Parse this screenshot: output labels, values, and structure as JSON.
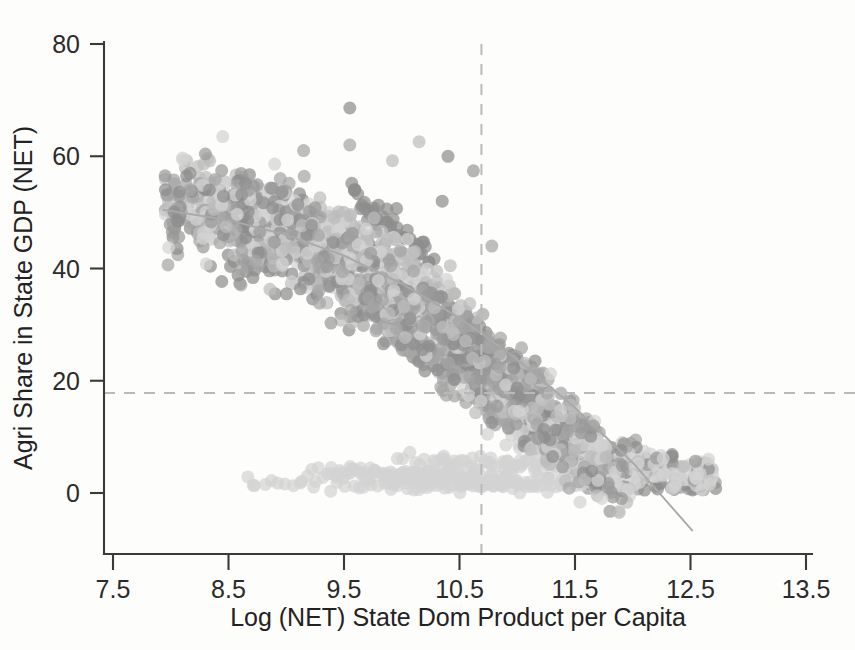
{
  "chart_data": {
    "type": "scatter",
    "title": "",
    "xlabel": "Log (NET) State Dom Product per Capita",
    "ylabel": "Agri Share in State GDP (NET)",
    "xlim": [
      7.5,
      13.5
    ],
    "ylim": [
      -10,
      85
    ],
    "x_ticks": [
      "7.5",
      "8.5",
      "9.5",
      "10.5",
      "11.5",
      "12.5",
      "13.5"
    ],
    "x_tick_values": [
      7.5,
      8.5,
      9.5,
      10.5,
      11.5,
      12.5,
      13.5
    ],
    "y_ticks": [
      "0",
      "20",
      "40",
      "60",
      "80"
    ],
    "y_tick_values": [
      0,
      20,
      40,
      60,
      80
    ],
    "grid": false,
    "legend": "none",
    "marker": {
      "shape": "circle",
      "size_px": 13,
      "opacity": 0.72,
      "palette": [
        "#8e8e8e",
        "#a5a5a5",
        "#bcbcbc",
        "#d2d2d2",
        "#9a9a9a"
      ]
    },
    "reference_lines": [
      {
        "name": "vertical-reference-line",
        "orientation": "vertical",
        "value": 10.69,
        "style": "dashed",
        "color": "#b9b9b9"
      },
      {
        "name": "horizontal-reference-line",
        "orientation": "horizontal",
        "value": 17.8,
        "style": "dashed",
        "color": "#b9b9b9"
      }
    ],
    "fit_line": {
      "name": "quadratic-fit-line",
      "color": "#a9a9a9",
      "points": [
        [
          7.93,
          50.5
        ],
        [
          8.5,
          48.6
        ],
        [
          9.0,
          46.0
        ],
        [
          9.5,
          42.3
        ],
        [
          10.0,
          37.3
        ],
        [
          10.5,
          31.2
        ],
        [
          11.0,
          23.8
        ],
        [
          11.5,
          15.2
        ],
        [
          12.0,
          5.4
        ],
        [
          12.52,
          -6.8
        ]
      ]
    },
    "series": [
      {
        "name": "state-year-observations",
        "x": [
          7.93,
          7.97,
          8.02,
          8.05,
          8.08,
          8.12,
          8.15,
          8.18,
          8.2,
          8.22,
          8.24,
          8.26,
          8.28,
          8.3,
          8.32,
          8.34,
          8.36,
          8.38,
          8.4,
          8.42,
          8.44,
          8.46,
          8.48,
          8.5,
          8.52,
          8.54,
          8.56,
          8.58,
          8.6,
          8.62,
          8.64,
          8.66,
          8.68,
          8.7,
          8.72,
          8.74,
          8.76,
          8.78,
          8.8,
          8.82,
          8.84,
          8.86,
          8.88,
          8.9,
          8.92,
          8.94,
          8.96,
          8.98,
          9.0,
          9.02,
          9.04,
          9.06,
          9.08,
          9.1,
          9.12,
          9.14,
          9.16,
          9.18,
          9.2,
          9.22,
          9.24,
          9.26,
          9.28,
          9.3,
          9.32,
          9.34,
          9.36,
          9.38,
          9.4,
          9.42,
          9.44,
          9.46,
          9.48,
          9.5,
          9.52,
          9.54,
          9.56,
          9.58,
          9.6,
          9.62,
          9.64,
          9.66,
          9.68,
          9.7,
          9.72,
          9.74,
          9.76,
          9.78,
          9.8,
          9.82,
          9.84,
          9.86,
          9.88,
          9.9,
          9.92,
          9.94,
          9.96,
          9.98,
          10.0,
          10.02,
          10.04,
          10.06,
          10.08,
          10.1,
          10.12,
          10.14,
          10.16,
          10.18,
          10.2,
          10.22,
          10.24,
          10.26,
          10.28,
          10.3,
          10.32,
          10.34,
          10.36,
          10.38,
          10.4,
          10.42,
          10.44,
          10.46,
          10.48,
          10.5,
          10.52,
          10.54,
          10.56,
          10.58,
          10.6,
          10.62,
          10.64,
          10.66,
          10.68,
          10.7,
          10.72,
          10.74,
          10.76,
          10.78,
          10.8,
          10.85,
          10.9,
          10.95,
          11.0,
          11.05,
          11.1,
          11.15,
          11.2,
          11.25,
          11.3,
          11.35,
          11.4,
          11.45,
          11.5,
          11.55,
          11.6,
          11.65,
          11.7,
          11.75,
          11.8,
          11.85,
          11.9,
          11.95,
          12.0,
          12.05,
          12.1,
          12.15,
          12.2,
          12.25,
          12.3,
          12.35,
          12.4,
          12.45,
          12.5
        ],
        "note": "approximately 1400 plotted observations forming a downward-sloping cloud"
      }
    ]
  },
  "axes": {
    "x_title": "Log (NET) State Dom Product per Capita",
    "y_title": "Agri Share in State GDP (NET)"
  }
}
